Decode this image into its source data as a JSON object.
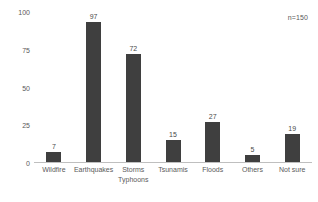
{
  "chart_data": {
    "type": "bar",
    "title": "",
    "subtitle": "",
    "xlabel": "",
    "ylabel": "",
    "categories": [
      "Wildfire",
      "Earthquakes",
      "Storms Typhoons",
      "Tsunamis",
      "Floods",
      "Others",
      "Not sure"
    ],
    "category_lines": [
      [
        "Wildfire"
      ],
      [
        "Earthquakes"
      ],
      [
        "Storms",
        "Typhoons"
      ],
      [
        "Tsunamis"
      ],
      [
        "Floods"
      ],
      [
        "Others"
      ],
      [
        "Not sure"
      ]
    ],
    "values": [
      7,
      97,
      72,
      15,
      27,
      5,
      19
    ],
    "ylim": [
      0,
      100
    ],
    "yticks": [
      0,
      25,
      50,
      75,
      100
    ],
    "ytick_labels": [
      "0",
      "25",
      "50",
      "75",
      "100"
    ],
    "grid": false,
    "legend": false,
    "legend_position": "none",
    "annotations": [
      {
        "text": "n=150",
        "position": "top-right"
      }
    ],
    "bar_color": "#3f3f3f",
    "text_color": "#5a5a5a",
    "baseline_color": "#bfbfbf",
    "background_color": "#ffffff"
  },
  "annotation": {
    "sample_size": "n=150"
  }
}
